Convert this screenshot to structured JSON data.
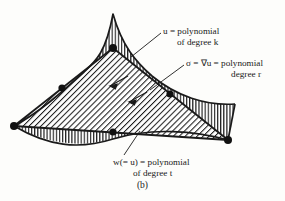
{
  "figure": {
    "caption": "(b)",
    "background_color": "#fdfdfb",
    "ink_color": "#1a1a1a"
  },
  "labels": {
    "u": {
      "line1": "u = polynomial",
      "line2": "of degree k",
      "symbol": "u",
      "degree": "k"
    },
    "sigma": {
      "line1": "σ = ∇u = polynomial",
      "line2": "degree r",
      "symbol": "σ",
      "degree": "r"
    },
    "w": {
      "line1": "w(= u) = polynomial",
      "line2": "of degree t",
      "symbol": "w",
      "degree": "t"
    }
  },
  "diagram": {
    "type": "finite-element-surface-diagram",
    "upper_surface_name": "u-surface",
    "inner_triangle_name": "sigma-triangle",
    "lower_surface_name": "w-surface",
    "outer_fill_pattern": "vertical-lines",
    "inner_fill_pattern": "diagonal-hatch",
    "nodes": [
      {
        "name": "vertex-left",
        "x": 14,
        "y": 126
      },
      {
        "name": "vertex-apex",
        "x": 113,
        "y": 48
      },
      {
        "name": "vertex-right",
        "x": 228,
        "y": 140
      },
      {
        "name": "midpoint-left-edge",
        "x": 62,
        "y": 88
      },
      {
        "name": "midpoint-right-edge",
        "x": 170,
        "y": 94
      },
      {
        "name": "midpoint-bottom",
        "x": 113,
        "y": 132
      }
    ],
    "gradient_arrows": [
      {
        "name": "gradient-arrow-1",
        "x": 118,
        "y": 81
      },
      {
        "name": "gradient-arrow-2",
        "x": 137,
        "y": 97
      }
    ]
  }
}
